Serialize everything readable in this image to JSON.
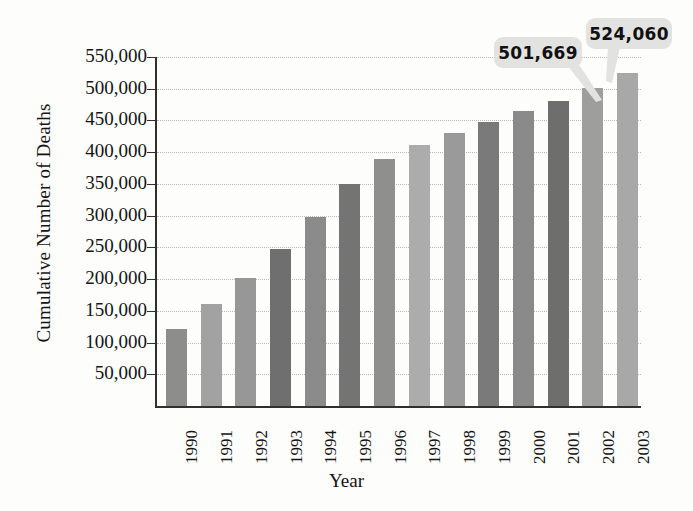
{
  "chart_data": {
    "type": "bar",
    "title": "",
    "xlabel": "Year",
    "ylabel": "Cumulative Number of Deaths",
    "categories": [
      "1990",
      "1991",
      "1992",
      "1993",
      "1994",
      "1995",
      "1996",
      "1997",
      "1998",
      "1999",
      "2000",
      "2001",
      "2002",
      "2003"
    ],
    "values": [
      121000,
      160000,
      202000,
      248000,
      298000,
      350000,
      390000,
      411000,
      430000,
      447000,
      465000,
      480000,
      501669,
      524060
    ],
    "ylim": [
      0,
      550000
    ],
    "ytick_labels": [
      "550,000",
      "500,000",
      "450,000",
      "400,000",
      "350,000",
      "300,000",
      "250,000",
      "200,000",
      "150,000",
      "100,000",
      "50,000"
    ],
    "ytick_values": [
      550000,
      500000,
      450000,
      400000,
      350000,
      300000,
      250000,
      200000,
      150000,
      100000,
      50000
    ],
    "grid": true,
    "legend": "none",
    "bar_colors": [
      "#8d8d8d",
      "#a2a2a2",
      "#979797",
      "#6f6f6f",
      "#8b8b8b",
      "#747474",
      "#8f8f8f",
      "#acacac",
      "#9a9a9a",
      "#7a7a7a",
      "#8a8a8a",
      "#6e6e6e",
      "#9e9e9e",
      "#a8a8a8"
    ],
    "annotations": [
      {
        "label": "501,669",
        "category": "2002",
        "value": 501669
      },
      {
        "label": "524,060",
        "category": "2003",
        "value": 524060
      }
    ]
  },
  "axis": {
    "y_title": "Cumulative Number of Deaths",
    "x_title": "Year"
  }
}
